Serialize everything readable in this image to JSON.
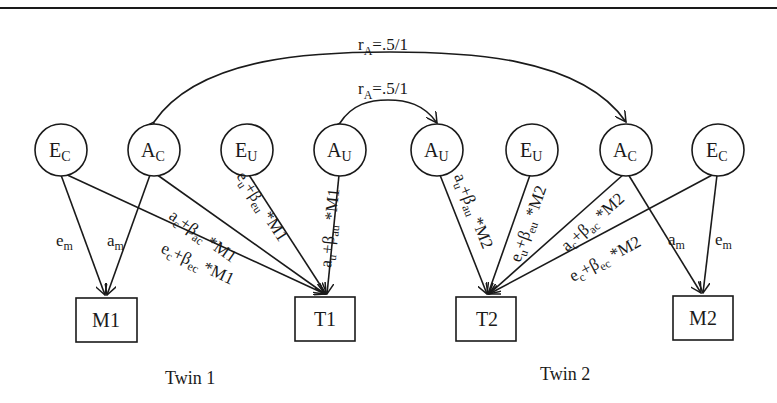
{
  "correlations": {
    "outer": {
      "label_main": "r",
      "label_sub": "A",
      "label_rest": "=.5/1",
      "connects": [
        "A_C twin1",
        "A_C twin2"
      ]
    },
    "inner": {
      "label_main": "r",
      "label_sub": "A",
      "label_rest": "=.5/1",
      "connects": [
        "A_U twin1",
        "A_U twin2"
      ]
    }
  },
  "latent_nodes": [
    {
      "id": "ec1",
      "main": "E",
      "sub": "C",
      "cx": 61,
      "cy": 150
    },
    {
      "id": "ac1",
      "main": "A",
      "sub": "C",
      "cx": 154,
      "cy": 150
    },
    {
      "id": "eu1",
      "main": "E",
      "sub": "U",
      "cx": 247,
      "cy": 150
    },
    {
      "id": "au1",
      "main": "A",
      "sub": "U",
      "cx": 340,
      "cy": 150
    },
    {
      "id": "au2",
      "main": "A",
      "sub": "U",
      "cx": 437,
      "cy": 150
    },
    {
      "id": "eu2",
      "main": "E",
      "sub": "U",
      "cx": 532,
      "cy": 150
    },
    {
      "id": "ac2",
      "main": "A",
      "sub": "C",
      "cx": 626,
      "cy": 150
    },
    {
      "id": "ec2",
      "main": "E",
      "sub": "C",
      "cx": 718,
      "cy": 150
    }
  ],
  "observed_nodes": [
    {
      "id": "m1",
      "label": "M1"
    },
    {
      "id": "t1",
      "label": "T1"
    },
    {
      "id": "t2",
      "label": "T2"
    },
    {
      "id": "m2",
      "label": "M2"
    }
  ],
  "path_labels": {
    "twin1": {
      "em": {
        "main": "e",
        "sub": "m"
      },
      "am": {
        "main": "a",
        "sub": "m"
      },
      "ac": {
        "p1": "a",
        "s1": "c",
        "p2": "+β",
        "s2": "ac",
        "p3": " *M1"
      },
      "ec": {
        "p1": "e",
        "s1": "c",
        "p2": "+β",
        "s2": "ec",
        "p3": " *M1"
      },
      "eu": {
        "p1": "e",
        "s1": "u",
        "p2": "+β",
        "s2": "eu",
        "p3": " *M1"
      },
      "au": {
        "p1": "a",
        "s1": "u",
        "p2": "+β",
        "s2": "au",
        "p3": " *M1"
      }
    },
    "twin2": {
      "au": {
        "p1": "a",
        "s1": "u",
        "p2": "+β",
        "s2": "au",
        "p3": " *M2"
      },
      "eu": {
        "p1": "e",
        "s1": "u",
        "p2": "+β",
        "s2": "eu",
        "p3": " *M2"
      },
      "ac": {
        "p1": "a",
        "s1": "c",
        "p2": "+β",
        "s2": "ac",
        "p3": " *M2"
      },
      "ec": {
        "p1": "e",
        "s1": "c",
        "p2": "+β",
        "s2": "ec",
        "p3": " *M2"
      },
      "am": {
        "main": "a",
        "sub": "m"
      },
      "em": {
        "main": "e",
        "sub": "m"
      }
    }
  },
  "twin_labels": {
    "twin1": "Twin 1",
    "twin2": "Twin 2"
  },
  "colors": {
    "ink": "#1a1a1a",
    "background": "#ffffff"
  }
}
